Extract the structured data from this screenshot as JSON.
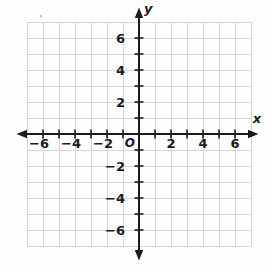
{
  "figure": {
    "width_px": 273,
    "height_px": 266,
    "colors": {
      "background": "#fdfdfd",
      "grid": "#d5d5d5",
      "axis": "#1b1b1b",
      "text": "#1b1b1b"
    }
  },
  "chart_data": {
    "type": "scatter",
    "title": "",
    "xlabel": "x",
    "ylabel": "y",
    "origin_label": "O",
    "xlim": [
      -7,
      7
    ],
    "ylim": [
      -7,
      7
    ],
    "grid": true,
    "grid_step": 1,
    "tick_step": 1,
    "label_step": 2,
    "series": [],
    "x_ticks": [
      {
        "value": -6,
        "label": "−6"
      },
      {
        "value": -4,
        "label": "−4"
      },
      {
        "value": -2,
        "label": "−2"
      },
      {
        "value": 2,
        "label": "2"
      },
      {
        "value": 4,
        "label": "4"
      },
      {
        "value": 6,
        "label": "6"
      }
    ],
    "y_ticks": [
      {
        "value": 6,
        "label": "6"
      },
      {
        "value": 4,
        "label": "4"
      },
      {
        "value": 2,
        "label": "2"
      },
      {
        "value": -2,
        "label": "−2"
      },
      {
        "value": -4,
        "label": "−4"
      },
      {
        "value": -6,
        "label": "−6"
      }
    ]
  }
}
